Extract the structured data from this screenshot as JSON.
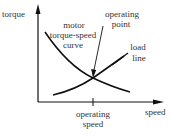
{
  "diagram": {
    "axes": {
      "y_label": "torque",
      "x_label": "speed"
    },
    "curves": {
      "motor": {
        "label_line1": "motor",
        "label_line2": "torque-speed",
        "label_line3": "curve"
      },
      "load": {
        "label_line1": "load",
        "label_line2": "line"
      }
    },
    "annotations": {
      "operating_point_line1": "operating",
      "operating_point_line2": "point",
      "operating_speed_line1": "operating",
      "operating_speed_line2": "speed"
    },
    "colors": {
      "ink": "#111111",
      "text": "#333333",
      "background": "#ffffff"
    }
  }
}
